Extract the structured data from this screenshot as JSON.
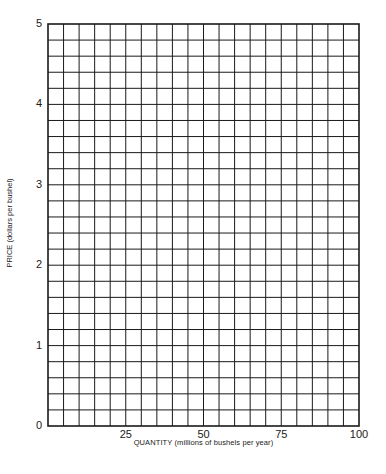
{
  "chart_data": {
    "type": "line",
    "title": "",
    "xlabel": "QUANTITY (millions of bushels per year)",
    "ylabel": "PRICE (dollars per bushel)",
    "xlim": [
      0,
      100
    ],
    "ylim": [
      0,
      5
    ],
    "x_ticks": [
      "25",
      "50",
      "75",
      "100"
    ],
    "x_tick_values": [
      25,
      50,
      75,
      100
    ],
    "y_ticks": [
      "0",
      "1",
      "2",
      "3",
      "4",
      "5"
    ],
    "y_tick_values": [
      0,
      1,
      2,
      3,
      4,
      5
    ],
    "grid": true,
    "grid_x_step": 5,
    "grid_y_step": 0.2,
    "grid_columns": 20,
    "grid_rows": 25,
    "series": [],
    "legend": null
  },
  "colors": {
    "grid": "#1a1a1a",
    "background": "#ffffff",
    "text": "#1a1a1a"
  }
}
